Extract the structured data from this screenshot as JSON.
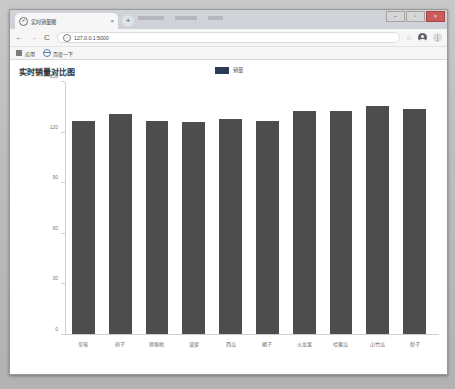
{
  "browser": {
    "tab": {
      "title": "实时销量图",
      "favicon_icon": "globe-icon",
      "close_icon": "×"
    },
    "new_tab_icon": "+",
    "window_controls": {
      "minimize": "–",
      "maximize": "▫",
      "close": "×"
    },
    "nav": {
      "back_icon": "←",
      "forward_icon": "→",
      "reload_icon": "C"
    },
    "omnibox": {
      "info_icon": "i",
      "url": "127.0.0.1:5000"
    },
    "toolbar_icons": {
      "bookmark_star": "☆",
      "profile": "profile-avatar",
      "menu": "three-dots-menu"
    },
    "bookmarks": [
      {
        "icon": "apps-grid-icon",
        "label": "应用"
      },
      {
        "icon": "globe-icon",
        "label": "百度一下"
      }
    ]
  },
  "page": {
    "title": "实时销量对比图"
  },
  "chart_data": {
    "type": "bar",
    "title": "实时销量对比图",
    "xlabel": "",
    "ylabel": "",
    "ylim": [
      0,
      150
    ],
    "yticks": [
      0,
      30,
      60,
      90,
      120,
      150
    ],
    "grid": false,
    "legend": {
      "position": "top-center",
      "entries": [
        "销量"
      ]
    },
    "series_color": "#2b3a55",
    "bar_color": "#4d4d4d",
    "categories": [
      "草莓",
      "柿子",
      "猕猴桃",
      "菠萝",
      "西瓜",
      "橘子",
      "火龙果",
      "哈蜜瓜",
      "山竹瓜",
      "梨子"
    ],
    "values": [
      127,
      131,
      127,
      126,
      128,
      127,
      133,
      133,
      136,
      134
    ],
    "series": [
      {
        "name": "销量",
        "values": [
          127,
          131,
          127,
          126,
          128,
          127,
          133,
          133,
          136,
          134
        ]
      }
    ]
  }
}
